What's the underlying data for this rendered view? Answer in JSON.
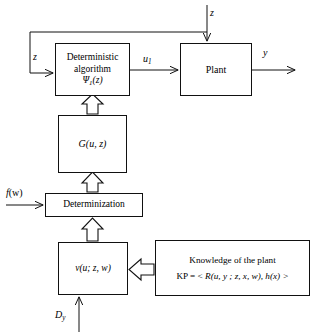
{
  "diagram": {
    "stroke_color": "#111111",
    "background_color": "#ffffff",
    "boxes": [
      {
        "id": "deterministic-algorithm",
        "lines": [
          "Deterministic",
          "algorithm",
          "Ψ₁(z)"
        ]
      },
      {
        "id": "plant",
        "lines": [
          "Plant"
        ]
      },
      {
        "id": "g-function",
        "lines": [
          "G(u, z)"
        ]
      },
      {
        "id": "determinization",
        "lines": [
          "Determinization"
        ]
      },
      {
        "id": "v-function",
        "lines": [
          "v(u; z, w)"
        ]
      },
      {
        "id": "knowledge-of-the-plant",
        "lines": [
          "Knowledge of the plant",
          "KP = < R(u, y ; z, x, w), h(x) >"
        ]
      }
    ],
    "box_text": {
      "det_alg_line1": "Deterministic",
      "det_alg_line2": "algorithm",
      "det_alg_line3_psi": "Ψ",
      "det_alg_line3_sub": "1",
      "det_alg_line3_arg": "(z)",
      "plant": "Plant",
      "g_name": "G",
      "g_args": "(u, z)",
      "determinization": "Determinization",
      "v_name": "v",
      "v_args": "(u; z, w)",
      "knowledge_title": "Knowledge of the plant",
      "knowledge_kp_prefix": "KP = < ",
      "knowledge_kp_R": "R",
      "knowledge_kp_Rargs": "(u, y ; z, x, w), ",
      "knowledge_kp_h": "h",
      "knowledge_kp_hargs": "(x) >"
    },
    "signal_labels": {
      "z_top": "z",
      "z_feedback": "z",
      "u1_name": "u",
      "u1_sub": "1",
      "y_output": "y",
      "f_name": "f",
      "f_args": "(w)",
      "d_name": "D",
      "d_sub": "y"
    },
    "connectors": [
      {
        "id": "z-into-plant",
        "style": "solid-arrow",
        "from": "top-edge",
        "to": "plant"
      },
      {
        "id": "feedback-z-to-algorithm",
        "style": "solid-arrow",
        "from": "z-junction",
        "to": "deterministic-algorithm"
      },
      {
        "id": "algorithm-to-plant-u1",
        "style": "solid-arrow",
        "from": "deterministic-algorithm",
        "to": "plant"
      },
      {
        "id": "plant-output-y",
        "style": "solid-arrow",
        "from": "plant",
        "to": "right-edge"
      },
      {
        "id": "g-to-algorithm",
        "style": "hollow-arrow",
        "from": "g-function",
        "to": "deterministic-algorithm"
      },
      {
        "id": "determinization-to-g",
        "style": "hollow-arrow",
        "from": "determinization",
        "to": "g-function"
      },
      {
        "id": "fw-to-determinization",
        "style": "solid-arrow",
        "from": "left-edge",
        "to": "determinization"
      },
      {
        "id": "v-to-determinization",
        "style": "hollow-arrow",
        "from": "v-function",
        "to": "determinization"
      },
      {
        "id": "knowledge-to-v",
        "style": "hollow-arrow",
        "from": "knowledge-of-the-plant",
        "to": "v-function"
      },
      {
        "id": "dy-to-v",
        "style": "solid-arrow",
        "from": "bottom-edge",
        "to": "v-function"
      }
    ]
  }
}
